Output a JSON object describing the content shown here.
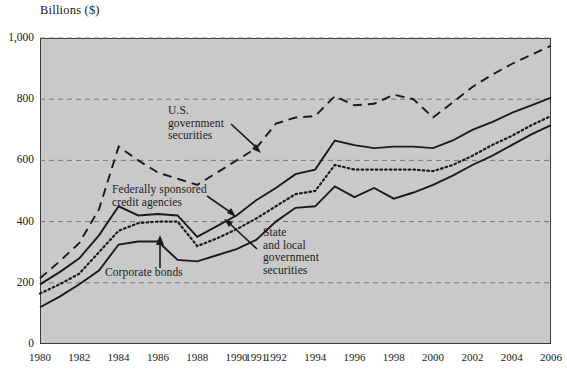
{
  "figure": {
    "axis_title": "Billions ($)",
    "background_color": "#c9c9c9",
    "line_color": "#1a1a1a"
  },
  "annotations": {
    "us_gov": {
      "line1": "U.S.",
      "line2": "government",
      "line3": "securities"
    },
    "fed_credit": {
      "line1": "Federally sponsored",
      "line2": "credit agencies"
    },
    "corporate": {
      "line1": "Corporate bonds"
    },
    "state_local": {
      "line1": "State",
      "line2": "and local",
      "line3": "government",
      "line4": "securities"
    }
  },
  "chart_data": {
    "type": "line",
    "title": "",
    "subtitle": "",
    "xlabel": "",
    "ylabel": "Billions ($)",
    "ylim": [
      0,
      1000
    ],
    "yticks": [
      0,
      200,
      400,
      600,
      800,
      1000
    ],
    "ytick_labels": [
      "0",
      "200",
      "400",
      "600",
      "800",
      "1,000"
    ],
    "grid": true,
    "grid_style": "dashed-horizontal",
    "legend": "annotated-inline",
    "x": [
      1980,
      1981,
      1982,
      1983,
      1984,
      1985,
      1986,
      1987,
      1988,
      1989,
      1990,
      1991,
      1992,
      1993,
      1994,
      1995,
      1996,
      1997,
      1998,
      1999,
      2000,
      2001,
      2002,
      2003,
      2004,
      2005,
      2006
    ],
    "xticks": [
      1980,
      1982,
      1984,
      1986,
      1988,
      1990,
      1991,
      1992,
      1994,
      1996,
      1998,
      2000,
      2002,
      2004,
      2006
    ],
    "xtick_labels": [
      "1980",
      "1982",
      "1984",
      "1986",
      "1988",
      "1990",
      "1991",
      "1992",
      "1994",
      "1996",
      "1998",
      "2000",
      "2002",
      "2004",
      "2006"
    ],
    "series": [
      {
        "name": "U.S. government securities",
        "style": "dashed",
        "values": [
          215,
          270,
          330,
          440,
          645,
          600,
          560,
          540,
          520,
          560,
          600,
          640,
          720,
          740,
          745,
          810,
          780,
          785,
          815,
          800,
          740,
          790,
          840,
          880,
          915,
          945,
          975
        ]
      },
      {
        "name": "Federally sponsored credit agencies",
        "style": "solid",
        "values": [
          195,
          235,
          280,
          355,
          450,
          420,
          425,
          420,
          350,
          385,
          420,
          470,
          510,
          555,
          570,
          665,
          650,
          640,
          645,
          645,
          640,
          665,
          700,
          725,
          755,
          780,
          805
        ]
      },
      {
        "name": "State and local government securities",
        "style": "dotted",
        "values": [
          165,
          195,
          230,
          300,
          370,
          395,
          400,
          400,
          320,
          345,
          375,
          410,
          450,
          490,
          500,
          585,
          570,
          570,
          570,
          570,
          565,
          585,
          615,
          650,
          680,
          715,
          745
        ]
      },
      {
        "name": "Corporate bonds",
        "style": "solid",
        "values": [
          120,
          155,
          195,
          240,
          325,
          335,
          335,
          275,
          270,
          290,
          310,
          340,
          400,
          445,
          450,
          515,
          480,
          510,
          475,
          495,
          520,
          550,
          585,
          615,
          650,
          685,
          715
        ]
      }
    ]
  }
}
